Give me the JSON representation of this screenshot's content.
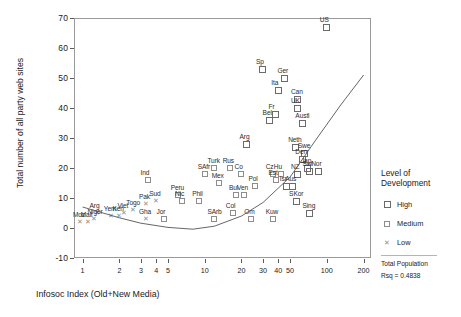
{
  "chart_data": {
    "type": "scatter",
    "title": "",
    "xlabel": "Infosoc Index (Old+New Media)",
    "ylabel": "Total number of all party web sites",
    "xscale": "log",
    "xlim": [
      0.85,
      230
    ],
    "ylim": [
      -10,
      70
    ],
    "grid": false,
    "xticks": [
      "1",
      "2",
      "3",
      "4",
      "5",
      "10",
      "20",
      "30",
      "40",
      "50",
      "100",
      "200"
    ],
    "xtick_values": [
      1,
      2,
      3,
      4,
      5,
      10,
      20,
      30,
      40,
      50,
      100,
      200
    ],
    "yticks": [
      "-10",
      "0",
      "10",
      "20",
      "30",
      "40",
      "50",
      "60",
      "70"
    ],
    "ytick_values": [
      -10,
      0,
      10,
      20,
      30,
      40,
      50,
      60,
      70
    ],
    "legend": {
      "position": "right",
      "title": "Level of Development",
      "entries": [
        {
          "label": "High",
          "marker": "large-open-square"
        },
        {
          "label": "Medium",
          "marker": "small-open-square"
        },
        {
          "label": "Low",
          "marker": "cross"
        }
      ],
      "notes": [
        "Total Population",
        "Rsq = 0.4838"
      ]
    },
    "fit_line": {
      "label": "Total Population",
      "rsq": 0.4838,
      "points": [
        [
          1,
          7.0
        ],
        [
          2,
          3.4
        ],
        [
          3,
          1.6
        ],
        [
          5,
          0.2
        ],
        [
          8,
          -0.4
        ],
        [
          12,
          0.6
        ],
        [
          20,
          4.0
        ],
        [
          30,
          8.5
        ],
        [
          50,
          17.0
        ],
        [
          80,
          29.0
        ],
        [
          130,
          41.0
        ],
        [
          200,
          51.0
        ]
      ]
    },
    "points": [
      {
        "label": "US",
        "x": 100,
        "y": 67,
        "group": "high"
      },
      {
        "label": "Sp",
        "x": 30,
        "y": 53,
        "group": "high"
      },
      {
        "label": "Ger",
        "x": 45,
        "y": 50,
        "group": "high"
      },
      {
        "label": "Ita",
        "x": 40,
        "y": 46,
        "group": "high"
      },
      {
        "label": "Can",
        "x": 58,
        "y": 43,
        "group": "high"
      },
      {
        "label": "UK",
        "x": 58,
        "y": 40,
        "group": "high"
      },
      {
        "label": "Fr",
        "x": 38,
        "y": 38,
        "group": "high"
      },
      {
        "label": "Bel",
        "x": 34,
        "y": 36,
        "group": "high"
      },
      {
        "label": "Austl",
        "x": 63,
        "y": 35,
        "group": "high"
      },
      {
        "label": "Arg",
        "x": 22,
        "y": 28,
        "group": "high"
      },
      {
        "label": "Neth",
        "x": 55,
        "y": 27,
        "group": "high"
      },
      {
        "label": "Swe",
        "x": 66,
        "y": 25,
        "group": "high"
      },
      {
        "label": "Den",
        "x": 63,
        "y": 23,
        "group": "high"
      },
      {
        "label": "Turk",
        "x": 12,
        "y": 20,
        "group": "medium"
      },
      {
        "label": "Rus",
        "x": 16,
        "y": 20,
        "group": "medium"
      },
      {
        "label": "Jap",
        "x": 70,
        "y": 20,
        "group": "high"
      },
      {
        "label": "Nor",
        "x": 85,
        "y": 19,
        "group": "high"
      },
      {
        "label": "SAfr",
        "x": 10,
        "y": 18,
        "group": "medium"
      },
      {
        "label": "Co",
        "x": 20,
        "y": 18,
        "group": "medium"
      },
      {
        "label": "Cz",
        "x": 36,
        "y": 18,
        "group": "medium"
      },
      {
        "label": "Hu",
        "x": 42,
        "y": 18,
        "group": "medium"
      },
      {
        "label": "Swi",
        "x": 72,
        "y": 19,
        "group": "high"
      },
      {
        "label": "NZ",
        "x": 58,
        "y": 18,
        "group": "high"
      },
      {
        "label": "Est",
        "x": 38,
        "y": 16,
        "group": "medium"
      },
      {
        "label": "Ind",
        "x": 3.4,
        "y": 16,
        "group": "medium"
      },
      {
        "label": "Mex",
        "x": 13,
        "y": 15,
        "group": "medium"
      },
      {
        "label": "Pol",
        "x": 26,
        "y": 14,
        "group": "medium"
      },
      {
        "label": "Isr",
        "x": 47,
        "y": 14,
        "group": "high"
      },
      {
        "label": "Aus",
        "x": 52,
        "y": 14,
        "group": "high"
      },
      {
        "label": "Peru",
        "x": 6,
        "y": 11,
        "group": "medium"
      },
      {
        "label": "Bul",
        "x": 18,
        "y": 11,
        "group": "medium"
      },
      {
        "label": "Ven",
        "x": 21,
        "y": 11,
        "group": "medium"
      },
      {
        "label": "Sud",
        "x": 4,
        "y": 9,
        "group": "low"
      },
      {
        "label": "Nic",
        "x": 6.5,
        "y": 9,
        "group": "medium"
      },
      {
        "label": "Phil",
        "x": 9,
        "y": 9,
        "group": "medium"
      },
      {
        "label": "SKor",
        "x": 56,
        "y": 9,
        "group": "high"
      },
      {
        "label": "Pak",
        "x": 3.3,
        "y": 8,
        "group": "low"
      },
      {
        "label": "Togo",
        "x": 2.6,
        "y": 6,
        "group": "low"
      },
      {
        "label": "Col",
        "x": 17,
        "y": 5,
        "group": "medium"
      },
      {
        "label": "Gha",
        "x": 3.3,
        "y": 3,
        "group": "low"
      },
      {
        "label": "Jor",
        "x": 4.6,
        "y": 3,
        "group": "medium"
      },
      {
        "label": "SArb",
        "x": 12,
        "y": 3,
        "group": "medium"
      },
      {
        "label": "Om",
        "x": 24,
        "y": 3,
        "group": "medium"
      },
      {
        "label": "Kuw",
        "x": 36,
        "y": 3,
        "group": "medium"
      },
      {
        "label": "Sing",
        "x": 72,
        "y": 5,
        "group": "high"
      },
      {
        "label": "Viet",
        "x": 2.2,
        "y": 5,
        "group": "low"
      },
      {
        "label": "Yem",
        "x": 1.7,
        "y": 4,
        "group": "low"
      },
      {
        "label": "Ken",
        "x": 2.0,
        "y": 4,
        "group": "low"
      },
      {
        "label": "Arg2",
        "x": 1.3,
        "y": 5,
        "group": "low"
      },
      {
        "label": "Niger",
        "x": 1.25,
        "y": 3,
        "group": "low"
      },
      {
        "label": "Mali",
        "x": 1.1,
        "y": 2,
        "group": "low"
      },
      {
        "label": "Moz",
        "x": 0.95,
        "y": 2,
        "group": "low"
      }
    ]
  }
}
